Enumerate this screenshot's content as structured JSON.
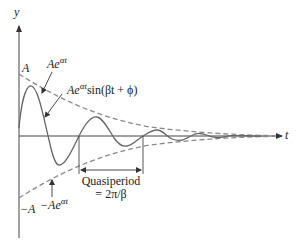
{
  "figure": {
    "type": "damped-oscillation-diagram",
    "axes": {
      "x_label": "t",
      "y_label": "y"
    },
    "labels": {
      "upper_intercept": "A",
      "lower_intercept": "−A",
      "upper_envelope": {
        "base": "Ae",
        "exp": "αt"
      },
      "lower_envelope": {
        "base": "−Ae",
        "exp": "αt"
      },
      "solution": {
        "base": "Ae",
        "exp": "αt",
        "tail": "sin(βt + ϕ)"
      },
      "quasiperiod_line1": "Quasiperiod",
      "quasiperiod_line2": "= 2π/β"
    },
    "colors": {
      "axis": "#444444",
      "curve": "#666666",
      "envelope": "#8a8a8a",
      "text": "#222222"
    }
  }
}
